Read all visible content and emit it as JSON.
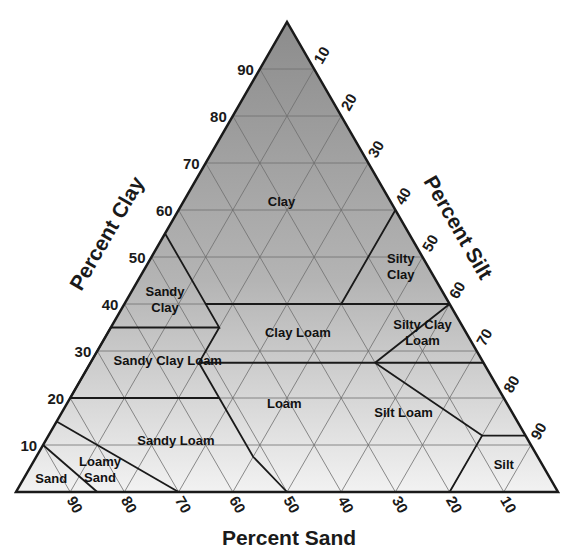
{
  "diagram": {
    "axes": {
      "clay": {
        "title": "Percent Clay",
        "ticks": [
          10,
          20,
          30,
          40,
          50,
          60,
          70,
          80,
          90
        ]
      },
      "silt": {
        "title": "Percent Silt",
        "ticks": [
          10,
          20,
          30,
          40,
          50,
          60,
          70,
          80,
          90
        ]
      },
      "sand": {
        "title": "Percent Sand",
        "ticks": [
          90,
          80,
          70,
          60,
          50,
          40,
          30,
          20,
          10
        ]
      }
    },
    "colors": {
      "fill_top": "#8c8c8c",
      "fill_bottom": "#f2f2f2",
      "grid": "#6e6e6e",
      "boundary": "#1a1a1a",
      "text": "#1a1a1a"
    },
    "regions": [
      {
        "name": "Clay",
        "label_lines": [
          "Clay"
        ],
        "label_at": {
          "clay": 62,
          "sand": 20
        }
      },
      {
        "name": "Sandy Clay",
        "label_lines": [
          "Sandy",
          "Clay"
        ],
        "label_at": {
          "clay": 41,
          "sand": 52
        }
      },
      {
        "name": "Silty Clay",
        "label_lines": [
          "Silty",
          "Clay"
        ],
        "label_at": {
          "clay": 48,
          "sand": 5
        }
      },
      {
        "name": "Clay Loam",
        "label_lines": [
          "Clay Loam"
        ],
        "label_at": {
          "clay": 34,
          "sand": 31
        }
      },
      {
        "name": "Silty Clay Loam",
        "label_lines": [
          "Silty Clay",
          "Loam"
        ],
        "label_at": {
          "clay": 34,
          "sand": 8
        }
      },
      {
        "name": "Sandy Clay Loam",
        "label_lines": [
          "Sandy Clay Loam"
        ],
        "label_at": {
          "clay": 28,
          "sand": 58
        }
      },
      {
        "name": "Loam",
        "label_lines": [
          "Loam"
        ],
        "label_at": {
          "clay": 19,
          "sand": 41
        }
      },
      {
        "name": "Silt Loam",
        "label_lines": [
          "Silt Loam"
        ],
        "label_at": {
          "clay": 17,
          "sand": 20
        }
      },
      {
        "name": "Sandy Loam",
        "label_lines": [
          "Sandy Loam"
        ],
        "label_at": {
          "clay": 11,
          "sand": 65
        }
      },
      {
        "name": "Loamy Sand",
        "label_lines": [
          "Loamy",
          "Sand"
        ],
        "label_at": {
          "clay": 5,
          "sand": 82
        }
      },
      {
        "name": "Sand",
        "label_lines": [
          "Sand"
        ],
        "label_at": {
          "clay": 3,
          "sand": 92
        }
      },
      {
        "name": "Silt",
        "label_lines": [
          "Silt"
        ],
        "label_at": {
          "clay": 6,
          "sand": 7
        }
      }
    ],
    "boundaries": [
      [
        {
          "c": 55,
          "s": 45
        },
        {
          "c": 35,
          "s": 45
        },
        {
          "c": 35,
          "s": 65
        }
      ],
      [
        {
          "c": 40,
          "s": 45
        },
        {
          "c": 40,
          "s": 20
        },
        {
          "c": 60,
          "s": 0
        }
      ],
      [
        {
          "c": 40,
          "s": 20
        },
        {
          "c": 40,
          "s": 0
        }
      ],
      [
        {
          "c": 35,
          "s": 45
        },
        {
          "c": 27.5,
          "s": 52.5
        },
        {
          "c": 27.5,
          "s": 20
        },
        {
          "c": 40,
          "s": 0
        }
      ],
      [
        {
          "c": 27.5,
          "s": 20
        },
        {
          "c": 27.5,
          "s": 0
        }
      ],
      [
        {
          "c": 35,
          "s": 65
        },
        {
          "c": 20,
          "s": 80
        }
      ],
      [
        {
          "c": 27.5,
          "s": 52.5
        },
        {
          "c": 20,
          "s": 52.5
        },
        {
          "c": 7.5,
          "s": 52.5
        },
        {
          "c": 0,
          "s": 50
        }
      ],
      [
        {
          "c": 20,
          "s": 80
        },
        {
          "c": 20,
          "s": 52.5
        }
      ],
      [
        {
          "c": 27.5,
          "s": 20
        },
        {
          "c": 12,
          "s": 8
        },
        {
          "c": 0,
          "s": 20
        }
      ],
      [
        {
          "c": 12,
          "s": 8
        },
        {
          "c": 12,
          "s": 0
        }
      ],
      [
        {
          "c": 15,
          "s": 85
        },
        {
          "c": 0,
          "s": 70
        }
      ],
      [
        {
          "c": 10,
          "s": 90
        },
        {
          "c": 0,
          "s": 85
        }
      ]
    ]
  }
}
